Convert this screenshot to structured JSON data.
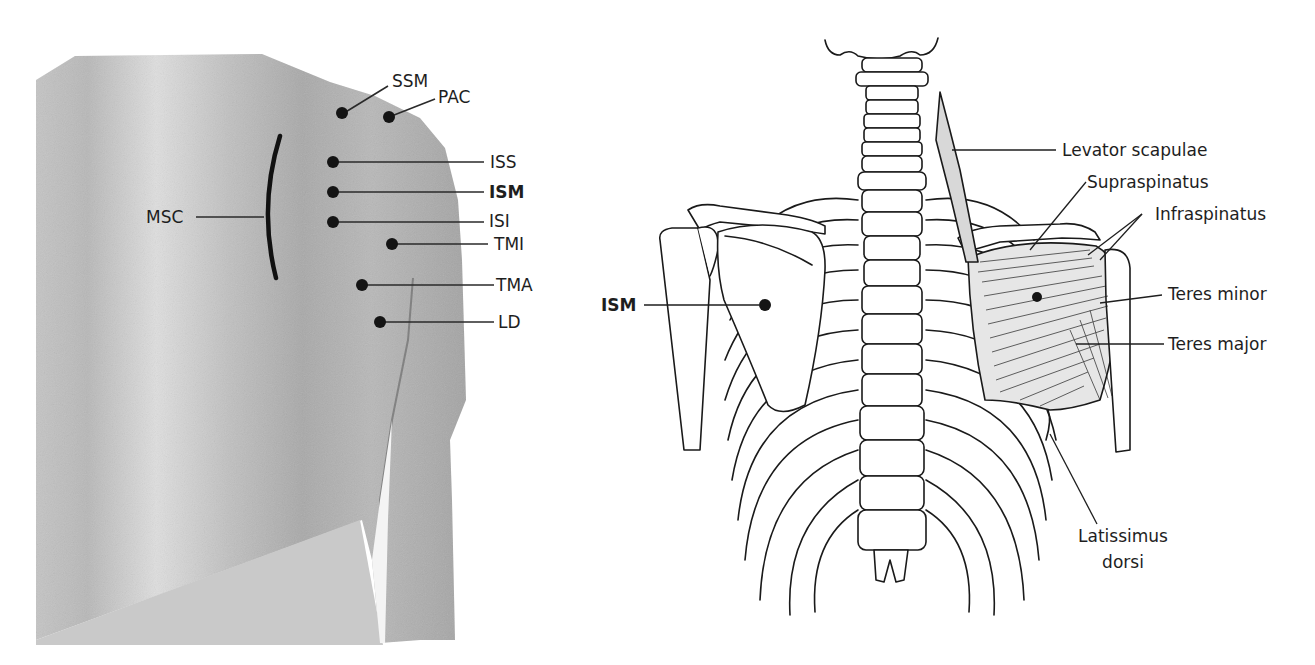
{
  "figure": {
    "left_panel": {
      "description": "Posterior view of torso skin surface with point markers",
      "landmark_curve": {
        "label": "MSC"
      },
      "points": [
        {
          "label": "SSM",
          "bold": false
        },
        {
          "label": "PAC",
          "bold": false
        },
        {
          "label": "ISS",
          "bold": false
        },
        {
          "label": "ISM",
          "bold": true
        },
        {
          "label": "ISI",
          "bold": false
        },
        {
          "label": "TMI",
          "bold": false
        },
        {
          "label": "TMA",
          "bold": false
        },
        {
          "label": "LD",
          "bold": false
        }
      ]
    },
    "right_panel": {
      "description": "Posterior skeletal and muscular anatomy of the shoulder and back",
      "point_label": "ISM",
      "muscle_labels": [
        "Levator scapulae",
        "Supraspinatus",
        "Infraspinatus",
        "Teres minor",
        "Teres major",
        "Latissimus",
        "dorsi"
      ]
    },
    "colors": {
      "skin_light": "#d2d2d2",
      "skin_dark": "#9c9c9c",
      "ink": "#1a1a1a",
      "background": "#ffffff"
    }
  }
}
